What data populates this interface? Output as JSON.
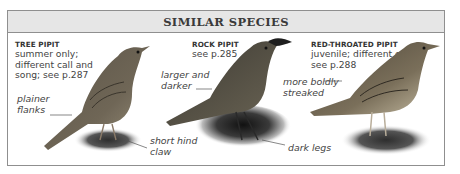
{
  "header": {
    "title": "SIMILAR SPECIES"
  },
  "species": [
    {
      "name": "TREE PIPIT",
      "description_lines": [
        "summer only;",
        "different call and",
        "song; see p.287"
      ],
      "annotations": [
        {
          "lines": [
            "plainer",
            "flanks"
          ]
        },
        {
          "lines": [
            "short hind",
            "claw"
          ]
        }
      ]
    },
    {
      "name": "ROCK PIPIT",
      "description_lines": [
        "see p.285"
      ],
      "annotations": [
        {
          "lines": [
            "larger and",
            "darker"
          ]
        },
        {
          "lines": [
            "dark legs"
          ]
        }
      ]
    },
    {
      "name": "RED-THROATED PIPIT",
      "description_lines": [
        "juvenile; different call;",
        "see p.288"
      ],
      "annotations": [
        {
          "lines": [
            "more boldly",
            "streaked"
          ]
        }
      ]
    }
  ],
  "colors": {
    "header_bg": "#e6e6e6",
    "border": "#8f8f8f",
    "text": "#444444"
  }
}
